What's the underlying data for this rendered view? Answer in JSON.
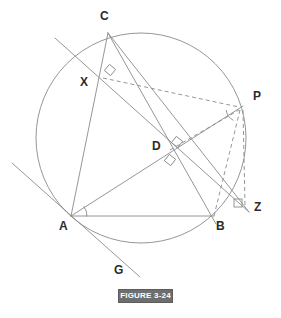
{
  "figure": {
    "caption": "FIGURE 3-24",
    "canvas": {
      "width": 281,
      "height": 318
    },
    "stroke_color": "#8a8a8a",
    "label_color": "#2b2b2b",
    "caption_bg": "#6e6e6e",
    "caption_fg": "#ffffff",
    "background": "#ffffff"
  },
  "circle": {
    "name": "circumscribed-circle",
    "cx": 141,
    "cy": 138,
    "r": 105
  },
  "points": [
    {
      "id": "C",
      "label": "C",
      "x": 108,
      "y": 33,
      "label_x": 100,
      "label_y": 10
    },
    {
      "id": "X",
      "label": "X",
      "x": 102,
      "y": 79,
      "label_x": 80,
      "label_y": 76
    },
    {
      "id": "P",
      "label": "P",
      "x": 240,
      "y": 108,
      "label_x": 253,
      "label_y": 90
    },
    {
      "id": "D",
      "label": "D",
      "x": 168,
      "y": 150,
      "label_x": 152,
      "label_y": 140
    },
    {
      "id": "Z",
      "label": "Z",
      "x": 245,
      "y": 208,
      "label_x": 254,
      "label_y": 201
    },
    {
      "id": "A",
      "label": "A",
      "x": 71,
      "y": 216,
      "label_x": 59,
      "label_y": 220
    },
    {
      "id": "B",
      "label": "B",
      "x": 214,
      "y": 216,
      "label_x": 216,
      "label_y": 220
    },
    {
      "id": "G",
      "label": "G",
      "x": 137,
      "y": 274,
      "label_x": 114,
      "label_y": 264
    }
  ],
  "solid_segments": [
    {
      "name": "segment-AB",
      "x1": 71,
      "y1": 216,
      "x2": 214,
      "y2": 216
    },
    {
      "name": "segment-AC",
      "x1": 71,
      "y1": 216,
      "x2": 108,
      "y2": 33
    },
    {
      "name": "segment-AD-P",
      "x1": 71,
      "y1": 216,
      "x2": 243,
      "y2": 106
    },
    {
      "name": "segment-CB",
      "x1": 108,
      "y1": 33,
      "x2": 216,
      "y2": 224
    },
    {
      "name": "segment-CXZ",
      "x1": 108,
      "y1": 33,
      "x2": 249,
      "y2": 212
    },
    {
      "name": "line-tangent-XG",
      "x1": 55,
      "y1": 38,
      "x2": 249,
      "y2": 212
    },
    {
      "name": "line-tangent-AG",
      "x1": 12,
      "y1": 163,
      "x2": 140,
      "y2": 277
    }
  ],
  "dashed_segments": [
    {
      "name": "dashed-XP",
      "x1": 103,
      "y1": 78,
      "x2": 239,
      "y2": 107
    },
    {
      "name": "dashed-DP",
      "x1": 170,
      "y1": 150,
      "x2": 239,
      "y2": 110
    },
    {
      "name": "dashed-PB",
      "x1": 240,
      "y1": 110,
      "x2": 214,
      "y2": 216
    },
    {
      "name": "dashed-PZ",
      "x1": 243,
      "y1": 110,
      "x2": 245,
      "y2": 205
    }
  ],
  "right_angle_marks": [
    {
      "name": "right-angle-at-X",
      "cx": 110,
      "cy": 70,
      "rot": -50
    },
    {
      "name": "right-angle-at-D-1",
      "cx": 177,
      "cy": 142,
      "rot": -52
    },
    {
      "name": "right-angle-at-D-2",
      "cx": 170,
      "cy": 160,
      "rot": 38
    },
    {
      "name": "right-angle-at-Z",
      "cx": 238,
      "cy": 203,
      "rot": 0
    }
  ],
  "angle_arcs": [
    {
      "name": "angle-arc-at-A",
      "cx": 71,
      "cy": 216,
      "r": 16,
      "a1": -38,
      "a2": 2
    },
    {
      "name": "angle-arc-at-P",
      "cx": 240,
      "cy": 108,
      "r": 14,
      "a1": 118,
      "a2": 172
    }
  ]
}
